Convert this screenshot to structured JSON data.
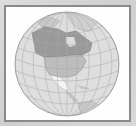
{
  "map": {
    "subject": "Orthographic globe centered on North America",
    "colors": {
      "background": "#d6d6d6",
      "frame_border": "#8a8a8a",
      "frame_fill": "#fdfdfd",
      "ocean": "#dedede",
      "graticule": "#a8a8a8",
      "canada": "#9a9a9a",
      "usa": "#bdbdbd",
      "mexico": "#f4f4f4",
      "other_land": "#c4c4c4"
    },
    "highlighted_regions": [
      "Canada",
      "United States",
      "Mexico"
    ]
  }
}
